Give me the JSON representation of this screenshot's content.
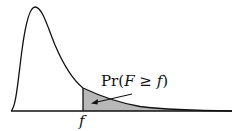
{
  "diagram": {
    "type": "F-distribution density with shaded upper tail",
    "annotation_label": "Pr(F ≥ f)",
    "annotation_parts": {
      "pr": "Pr(",
      "F": "F",
      "geq": " ≥ ",
      "f": "f",
      "close": ")"
    },
    "critical_value_label": "f",
    "colors": {
      "curve": "#111111",
      "shade": "#b8b8b8",
      "background": "#ffffff"
    }
  }
}
